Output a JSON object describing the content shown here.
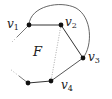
{
  "diagram": {
    "type": "planar-graph-face",
    "face_label": "F",
    "vertices": [
      {
        "id": "v1",
        "label": "v",
        "sub": "1"
      },
      {
        "id": "v2",
        "label": "v",
        "sub": "2"
      },
      {
        "id": "v3",
        "label": "v",
        "sub": "3"
      },
      {
        "id": "v4",
        "label": "v",
        "sub": "4"
      }
    ],
    "edges": [
      {
        "from": "v1",
        "to": "v2",
        "style": "solid"
      },
      {
        "from": "v2",
        "to": "v3",
        "style": "solid"
      },
      {
        "from": "v3",
        "to": "v4",
        "style": "solid"
      },
      {
        "from": "v1",
        "to": "v3",
        "style": "solid-arc"
      },
      {
        "from": "v2",
        "to": "v4",
        "style": "dotted"
      }
    ],
    "colors": {
      "line": "#555555",
      "node": "#111111",
      "dotted": "#888888"
    }
  }
}
